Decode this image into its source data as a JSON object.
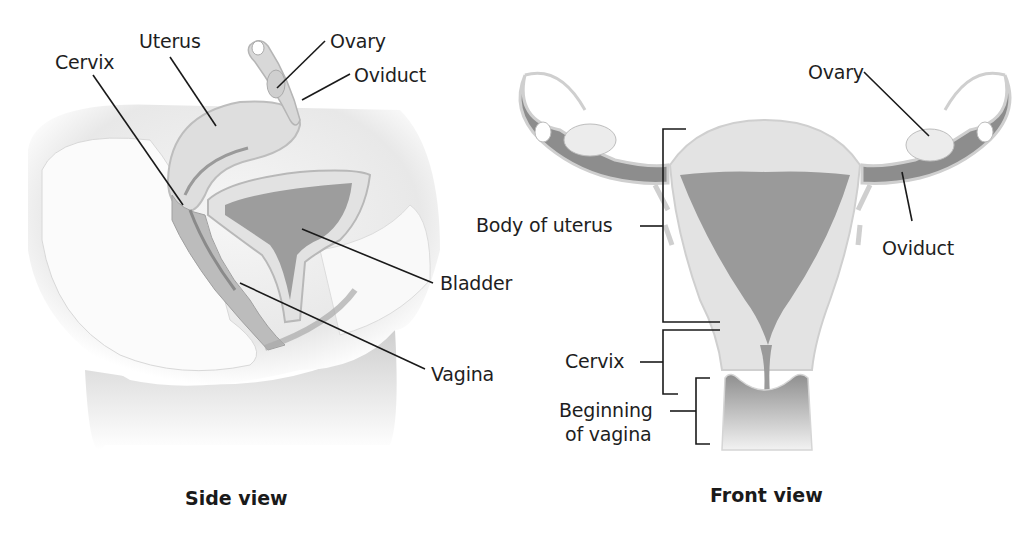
{
  "side_view": {
    "caption": "Side view",
    "labels": {
      "cervix": "Cervix",
      "uterus": "Uterus",
      "ovary": "Ovary",
      "oviduct": "Oviduct",
      "bladder": "Bladder",
      "vagina": "Vagina"
    }
  },
  "front_view": {
    "caption": "Front view",
    "labels": {
      "ovary": "Ovary",
      "oviduct": "Oviduct",
      "body_of_uterus": "Body of uterus",
      "cervix": "Cervix",
      "beginning_of_vagina_line1": "Beginning",
      "beginning_of_vagina_line2": "of vagina"
    }
  },
  "colors": {
    "line": "#1a1a1a",
    "tissue_light": "#e4e4e4",
    "tissue_mid": "#bdbdbd",
    "tissue_dark": "#8e8e8e"
  }
}
